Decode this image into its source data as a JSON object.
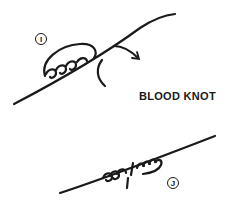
{
  "diagram": {
    "title": "BLOOD KNOT",
    "steps": [
      {
        "id": "I",
        "label": "I",
        "description": "turns wrapped around line, end passed back through center"
      },
      {
        "id": "J",
        "label": "J",
        "description": "completed knot with turns on both sides"
      }
    ],
    "colors": {
      "ink": "#1a1a1a",
      "background": "#ffffff"
    }
  }
}
